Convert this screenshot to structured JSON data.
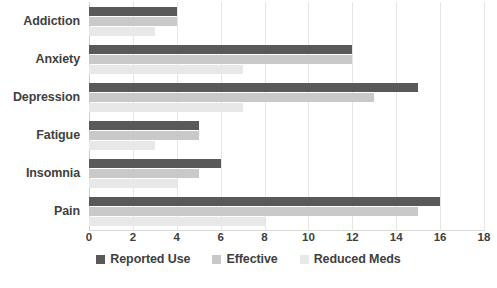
{
  "chart_data": {
    "type": "bar",
    "orientation": "horizontal",
    "title": "",
    "subtitle": "",
    "xlabel": "",
    "ylabel": "",
    "xlim": [
      0,
      18
    ],
    "xticks": [
      0,
      2,
      4,
      6,
      8,
      10,
      12,
      14,
      16,
      18
    ],
    "xtick_labels": [
      "0",
      "2",
      "4",
      "6",
      "8",
      "10",
      "12",
      "14",
      "16",
      "18"
    ],
    "grid": true,
    "grid_axis": "x",
    "legend_position": "bottom",
    "categories": [
      "Addiction",
      "Anxiety",
      "Depression",
      "Fatigue",
      "Insomnia",
      "Pain"
    ],
    "series": [
      {
        "name": "Reported Use",
        "color": "#595959",
        "values": [
          4,
          12,
          15,
          5,
          6,
          16
        ]
      },
      {
        "name": "Effective",
        "color": "#c9c9c9",
        "values": [
          4,
          12,
          13,
          5,
          5,
          15
        ]
      },
      {
        "name": "Reduced Meds",
        "color": "#e8e8e8",
        "values": [
          3,
          7,
          7,
          3,
          4,
          8
        ]
      }
    ]
  },
  "colors": {
    "series_reported_use": "#595959",
    "series_effective": "#c9c9c9",
    "series_reduced_meds": "#e8e8e8",
    "gridline": "#e6e6e6",
    "axis": "#d9d9d9",
    "text": "#3f3f3f",
    "background": "#ffffff"
  }
}
